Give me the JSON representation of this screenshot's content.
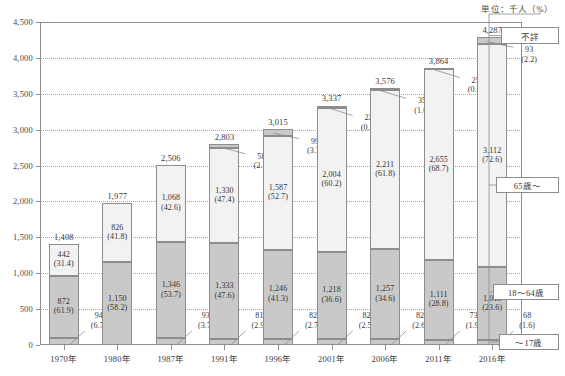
{
  "unit_note": "単位：千人（%）",
  "legend": [
    {
      "key": "unknown",
      "label": "不詳"
    },
    {
      "key": "age65",
      "label": "65歳～"
    },
    {
      "key": "age1864",
      "label": "18～64歳"
    },
    {
      "key": "age17",
      "label": "～17歳"
    }
  ],
  "chart_data": {
    "type": "bar",
    "stacked": true,
    "title": "",
    "xlabel": "",
    "ylabel": "",
    "unit": "単位：千人（%）",
    "ylim": [
      0,
      4500
    ],
    "yticks": [
      "0",
      "500",
      "1,000",
      "1,500",
      "2,000",
      "2,500",
      "3,000",
      "3,500",
      "4,000",
      "4,500"
    ],
    "grid": true,
    "legend_position": "right",
    "categories": [
      "1970年",
      "1980年",
      "1987年",
      "1991年",
      "1996年",
      "2001年",
      "2006年",
      "2011年",
      "2016年"
    ],
    "totals": [
      "1,408",
      "1,977",
      "2,506",
      "2,803",
      "3,015",
      "3,337",
      "3,576",
      "3,864",
      "4,287"
    ],
    "totals_num": [
      1408,
      1977,
      2506,
      2803,
      3015,
      3337,
      3576,
      3864,
      4287
    ],
    "series": [
      {
        "name": "～17歳",
        "values": [
          94,
          null,
          93,
          81,
          82,
          82,
          82,
          73,
          68
        ],
        "labels": [
          "94",
          "",
          "93",
          "81",
          "82",
          "82",
          "82",
          "73",
          "68"
        ],
        "pct_labels": [
          "(6.7)",
          "",
          "(3.7)",
          "(2.9)",
          "(2.7)",
          "(2.5)",
          "(2.6)",
          "(1.9)",
          "(1.6)"
        ],
        "pct": [
          6.7,
          null,
          3.7,
          2.9,
          2.7,
          2.5,
          2.6,
          1.9,
          1.6
        ]
      },
      {
        "name": "18～64歳",
        "values": [
          872,
          1150,
          1346,
          1333,
          1246,
          1218,
          1257,
          1111,
          1013
        ],
        "labels": [
          "872",
          "1,150",
          "1,346",
          "1,333",
          "1,246",
          "1,218",
          "1,257",
          "1,111",
          "1,013"
        ],
        "pct_labels": [
          "(61.9)",
          "(58.2)",
          "(53.7)",
          "(47.6)",
          "(41.3)",
          "(36.6)",
          "(34.6)",
          "(28.8)",
          "(23.6)"
        ],
        "pct": [
          61.9,
          58.2,
          53.7,
          47.6,
          41.3,
          36.6,
          34.6,
          28.8,
          23.6
        ]
      },
      {
        "name": "65歳～",
        "values": [
          442,
          826,
          1068,
          1330,
          1587,
          2004,
          2211,
          2655,
          3112
        ],
        "labels": [
          "442",
          "826",
          "1,068",
          "1,330",
          "1,587",
          "2,004",
          "2,211",
          "2,655",
          "3,112"
        ],
        "pct_labels": [
          "(31.4)",
          "(41.8)",
          "(42.6)",
          "(47.4)",
          "(52.7)",
          "(60.2)",
          "(61.8)",
          "(68.7)",
          "(72.6)"
        ],
        "pct": [
          31.4,
          41.8,
          42.6,
          47.4,
          52.7,
          60.2,
          61.8,
          68.7,
          72.6
        ]
      },
      {
        "name": "不詳",
        "values": [
          null,
          null,
          null,
          58,
          99,
          22,
          35,
          25,
          93
        ],
        "labels": [
          "",
          "",
          "",
          "58",
          "99",
          "22",
          "35",
          "25",
          "93"
        ],
        "pct_labels": [
          "",
          "",
          "",
          "(2.1)",
          "(3.3)",
          "(0.7)",
          "(1.0)",
          "(0.6)",
          "(2.2)"
        ],
        "pct": [
          null,
          null,
          null,
          2.1,
          3.3,
          0.7,
          1.0,
          0.6,
          2.2
        ]
      }
    ]
  }
}
